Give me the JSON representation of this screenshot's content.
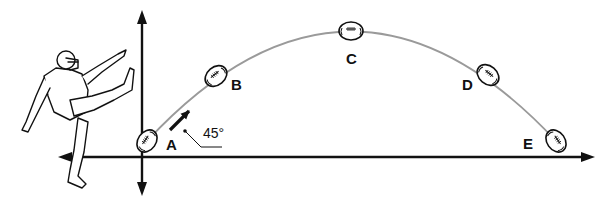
{
  "diagram": {
    "launch_angle": "45°",
    "labels": {
      "a": "A",
      "b": "B",
      "c": "C",
      "d": "D",
      "e": "E"
    },
    "positions": [
      {
        "label": "A",
        "description": "launch point",
        "x": 147,
        "y": 141
      },
      {
        "label": "B",
        "description": "rising",
        "x": 216,
        "y": 76
      },
      {
        "label": "C",
        "description": "peak",
        "x": 351,
        "y": 31
      },
      {
        "label": "D",
        "description": "descending",
        "x": 488,
        "y": 75
      },
      {
        "label": "E",
        "description": "landing",
        "x": 556,
        "y": 141
      }
    ],
    "elements": {
      "kicker": "football kicker illustration",
      "trajectory": "parabolic path",
      "velocity_arrow": "initial velocity vector",
      "x_axis": "horizontal axis",
      "y_axis": "vertical axis"
    },
    "colors": {
      "ink": "#111111",
      "trajectory": "#9a9a9a",
      "background": "#ffffff"
    }
  }
}
